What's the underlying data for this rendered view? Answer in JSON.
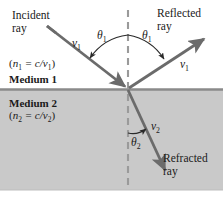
{
  "figure": {
    "type": "optics-ray-diagram",
    "width": 223,
    "height": 197,
    "colors": {
      "ray": "#6b6b6b",
      "medium2_fill": "#c9c9c9",
      "boundary_line": "#8a8a8a",
      "normal_dash": "#9a9a9a",
      "text": "#1a1a1a",
      "background": "#ffffff"
    }
  },
  "labels": {
    "incident_ray": "Incident\nray",
    "incident_ray_line1": "Incident",
    "incident_ray_line2": "ray",
    "reflected_ray_line1": "Reflected",
    "reflected_ray_line2": "ray",
    "refracted_ray_line1": "Refracted",
    "refracted_ray_line2": "ray",
    "medium1": "Medium 1",
    "medium2": "Medium 2",
    "medium1_formula_open": "(",
    "medium1_formula_n": "n",
    "medium1_formula_nsub": "1",
    "medium1_formula_eq": " = c/",
    "medium1_formula_v": "v",
    "medium1_formula_vsub": "1",
    "medium1_formula_close": ")",
    "medium2_formula_open": "(",
    "medium2_formula_n": "n",
    "medium2_formula_nsub": "2",
    "medium2_formula_eq": " = c/",
    "medium2_formula_v": "v",
    "medium2_formula_vsub": "2",
    "medium2_formula_close": ")",
    "theta1_incident": "θ",
    "theta1_incident_sub": "1",
    "theta1_reflected": "θ",
    "theta1_reflected_sub": "1",
    "theta2": "θ",
    "theta2_sub": "2",
    "v1_incident": "v",
    "v1_incident_sub": "1",
    "v1_reflected": "v",
    "v1_reflected_sub": "1",
    "v2_refracted": "v",
    "v2_refracted_sub": "2"
  },
  "geometry": {
    "interface_y": 89,
    "normal_x": 128,
    "origin_x": 128,
    "origin_y": 89,
    "incident_start_x": 47,
    "incident_start_y": 26,
    "reflected_end_x": 206,
    "reflected_end_y": 37,
    "refracted_end_x": 167,
    "refracted_end_y": 173,
    "normal_top_y": 10,
    "normal_bottom_y": 190,
    "medium2_top_y": 90,
    "medium2_bottom_y": 190
  },
  "annotations": {
    "theta1_note": "angle of incidence equals angle of reflection",
    "theta2_note": "angle of refraction measured from the normal",
    "v_note": "v denotes wave speed in each medium"
  }
}
